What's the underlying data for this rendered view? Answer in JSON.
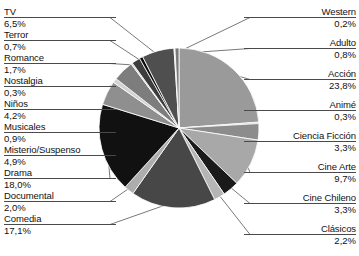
{
  "chart_data": {
    "type": "pie",
    "title": "",
    "xlabel": "",
    "ylabel": "",
    "legend_position": "callout-labels-both-sides",
    "grid": false,
    "unit": "%",
    "decimal_separator": ",",
    "categories": [
      "Acción",
      "Animé",
      "Ciencia Ficción",
      "Cine Arte",
      "Cine Chileno",
      "Clásicos",
      "Comedia",
      "Documental",
      "Drama",
      "Misterio/Suspenso",
      "Musicales",
      "Niños",
      "Nostalgia",
      "Romance",
      "Terror",
      "TV",
      "Western",
      "Adulto"
    ],
    "values": [
      23.8,
      0.3,
      3.3,
      9.7,
      3.3,
      2.2,
      17.1,
      2.0,
      18.0,
      4.9,
      0.9,
      4.2,
      0.3,
      1.7,
      0.7,
      6.5,
      0.2,
      0.8
    ],
    "slices": [
      {
        "label": "Acción",
        "value": 23.8,
        "display": "23,8%",
        "color": "#9a9a9a"
      },
      {
        "label": "Animé",
        "value": 0.3,
        "display": "0,3%",
        "color": "#c9c9c9"
      },
      {
        "label": "Ciencia Ficción",
        "value": 3.3,
        "display": "3,3%",
        "color": "#8c8c8c"
      },
      {
        "label": "Cine Arte",
        "value": 9.7,
        "display": "9,7%",
        "color": "#a8a8a8"
      },
      {
        "label": "Cine Chileno",
        "value": 3.3,
        "display": "3,3%",
        "color": "#1a1a1a"
      },
      {
        "label": "Clásicos",
        "value": 2.2,
        "display": "2,2%",
        "color": "#b5b5b5"
      },
      {
        "label": "Comedia",
        "value": 17.1,
        "display": "17,1%",
        "color": "#474747"
      },
      {
        "label": "Documental",
        "value": 2.0,
        "display": "2,0%",
        "color": "#adadad"
      },
      {
        "label": "Drama",
        "value": 18.0,
        "display": "18,0%",
        "color": "#111111"
      },
      {
        "label": "Misterio/Suspenso",
        "value": 4.9,
        "display": "4,9%",
        "color": "#8f8f8f"
      },
      {
        "label": "Musicales",
        "value": 0.9,
        "display": "0,9%",
        "color": "#d2d2d2"
      },
      {
        "label": "Niños",
        "value": 4.2,
        "display": "4,2%",
        "color": "#7d7d7d"
      },
      {
        "label": "Nostalgia",
        "value": 0.3,
        "display": "0,3%",
        "color": "#cfcfcf"
      },
      {
        "label": "Romance",
        "value": 1.7,
        "display": "1,7%",
        "color": "#3d3d3d"
      },
      {
        "label": "Terror",
        "value": 0.7,
        "display": "0,7%",
        "color": "#0d0d0d"
      },
      {
        "label": "TV",
        "value": 6.5,
        "display": "6,5%",
        "color": "#4f4f4f"
      },
      {
        "label": "Western",
        "value": 0.2,
        "display": "0,2%",
        "color": "#bfbfbf"
      },
      {
        "label": "Adulto",
        "value": 0.8,
        "display": "0,8%",
        "color": "#7a7a7a"
      }
    ]
  },
  "labels_left": [
    {
      "name": "TV",
      "value": "6,5%",
      "y": 6
    },
    {
      "name": "Terror",
      "value": "0,7%",
      "y": 29
    },
    {
      "name": "Romance",
      "value": "1,7%",
      "y": 52
    },
    {
      "name": "Nostalgia",
      "value": "0,3%",
      "y": 75
    },
    {
      "name": "Niños",
      "value": "4,2%",
      "y": 98
    },
    {
      "name": "Musicales",
      "value": "0,9%",
      "y": 121
    },
    {
      "name": "Misterio/Suspenso",
      "value": "4,9%",
      "y": 144
    },
    {
      "name": "Drama",
      "value": "18,0%",
      "y": 167
    },
    {
      "name": "Documental",
      "value": "2,0%",
      "y": 190
    },
    {
      "name": "Comedia",
      "value": "17,1%",
      "y": 213
    }
  ],
  "labels_right": [
    {
      "name": "Western",
      "value": "0,2%",
      "y": 6
    },
    {
      "name": "Adulto",
      "value": "0,8%",
      "y": 37
    },
    {
      "name": "Acción",
      "value": "23,8%",
      "y": 68
    },
    {
      "name": "Animé",
      "value": "0,3%",
      "y": 99
    },
    {
      "name": "Ciencia Ficción",
      "value": "3,3%",
      "y": 130
    },
    {
      "name": "Cine Arte",
      "value": "9,7%",
      "y": 161
    },
    {
      "name": "Cine Chileno",
      "value": "3,3%",
      "y": 192
    },
    {
      "name": "Clásicos",
      "value": "2,2%",
      "y": 223
    }
  ]
}
